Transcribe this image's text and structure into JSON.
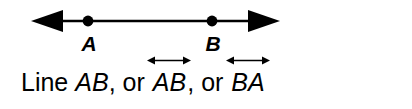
{
  "figure": {
    "background_color": "#ffffff",
    "stroke_color": "#000000",
    "diagram": {
      "type": "line-with-two-points",
      "line_label": "line-AB",
      "points": [
        {
          "label": "A",
          "x": 88
        },
        {
          "label": "B",
          "x": 212
        }
      ],
      "left_arrowhead": "arrow-left",
      "right_arrowhead": "arrow-right",
      "line_y": 21,
      "line_start_x": 31,
      "line_end_x": 280
    },
    "caption": {
      "word_line": "Line",
      "name_1": "AB",
      "separator_1": ",",
      "or_1": "or",
      "name_2": "AB",
      "separator_2": ",",
      "or_2": "or",
      "name_3": "BA",
      "notation_1": "line-notation-double-arrow",
      "notation_2": "line-notation-double-arrow",
      "full_text": "Line AB, or AB, or BA"
    }
  }
}
